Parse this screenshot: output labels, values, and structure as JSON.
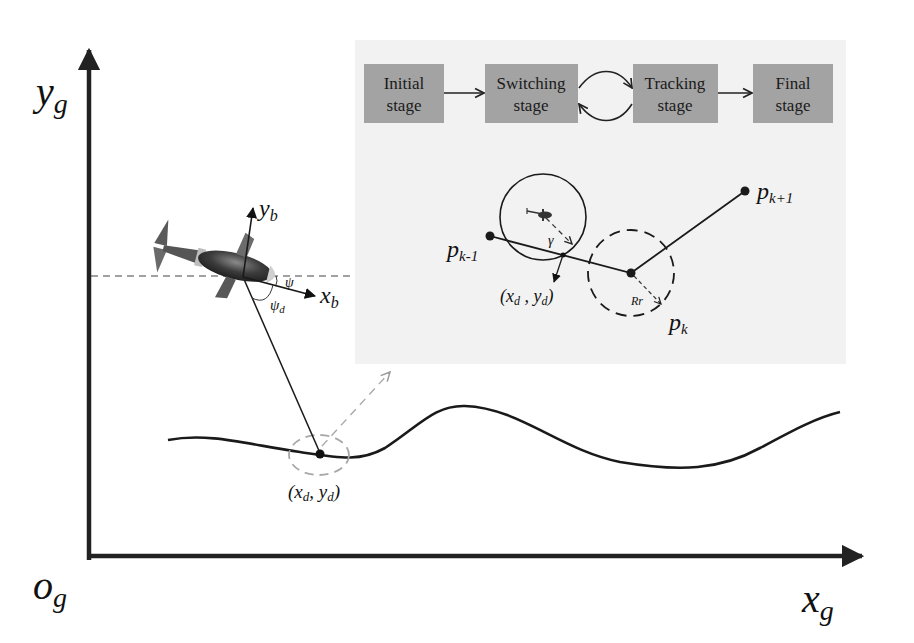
{
  "axes": {
    "y_label": "y",
    "y_sub": "g",
    "x_label": "x",
    "x_sub": "g",
    "origin_label": "o",
    "origin_sub": "g"
  },
  "body_frame": {
    "yb_label": "y",
    "yb_sub": "b",
    "xb_label": "x",
    "xb_sub": "b",
    "psi_label": "ψ",
    "psid_label": "ψ",
    "psid_sub": "d"
  },
  "path_point": {
    "label": "(x",
    "sub1": "d",
    "mid": ", y",
    "sub2": "d",
    "end": ")"
  },
  "inset": {
    "background": "#f2f2f2",
    "stage_box_color": "#a0a0a0",
    "stages": [
      {
        "line1": "Initial",
        "line2": "stage"
      },
      {
        "line1": "Switching",
        "line2": "stage"
      },
      {
        "line1": "Tracking",
        "line2": "stage"
      },
      {
        "line1": "Final",
        "line2": "stage"
      }
    ],
    "waypoints": {
      "prev": {
        "label": "p",
        "sub": "k-1"
      },
      "curr": {
        "label": "p",
        "sub": "k"
      },
      "next": {
        "label": "p",
        "sub": "k+1"
      }
    },
    "gamma_label": "γ",
    "radius_label": "Rr",
    "target": {
      "label": "(x",
      "sub1": "d",
      "mid": " , y",
      "sub2": "d",
      "end": ")"
    }
  }
}
